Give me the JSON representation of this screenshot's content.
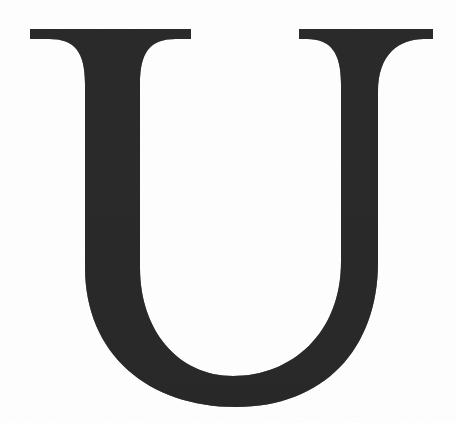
{
  "image": {
    "kind": "scanned-letterform",
    "subject_label": "U",
    "description": "Large serif capital letter U",
    "width": 456,
    "height": 423,
    "background_color": "#fefefe",
    "glyph_color": "#2b2b2b",
    "glyph_color_shade": "#1f1f1f",
    "alt_text": "Large dark serif capital letter U centered on a white background"
  },
  "glyph": {
    "character": "U",
    "style": "serif",
    "case": "uppercase",
    "left_serif": {
      "x_start": 30,
      "x_end": 191,
      "y_top": 29,
      "thickness": 10
    },
    "right_serif": {
      "x_start": 299,
      "x_end": 433,
      "y_top": 29,
      "thickness": 10
    },
    "left_stem": {
      "outer_x": 85,
      "inner_x": 140,
      "width": 55
    },
    "right_stem": {
      "outer_x": 378,
      "inner_x": 349,
      "width": 29
    },
    "bowl": {
      "outer_bottom_y": 405,
      "inner_bottom_y": 370
    }
  }
}
